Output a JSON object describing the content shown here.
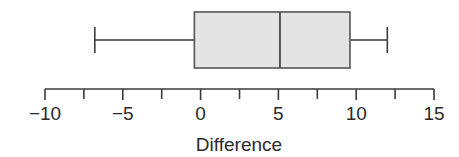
{
  "chart_data": {
    "type": "box",
    "orientation": "horizontal",
    "title": "",
    "xlabel": "Difference",
    "ylabel": "",
    "xlim": [
      -10,
      15
    ],
    "major_ticks": [
      -10,
      -5,
      0,
      5,
      10,
      15
    ],
    "major_tick_labels": [
      "−10",
      "−5",
      "0",
      "5",
      "10",
      "15"
    ],
    "minor_ticks": [
      -7.5,
      -2.5,
      2.5,
      7.5,
      12.5
    ],
    "grid": false,
    "legend": null,
    "box": {
      "whisker_low": -6.8,
      "q1": -0.4,
      "median": 5.1,
      "q3": 9.6,
      "whisker_high": 12.0
    },
    "colors": {
      "box_fill": "#e4e4e4",
      "box_stroke": "#555555",
      "axis": "#3a3a3a",
      "text": "#2a2a2a"
    }
  }
}
